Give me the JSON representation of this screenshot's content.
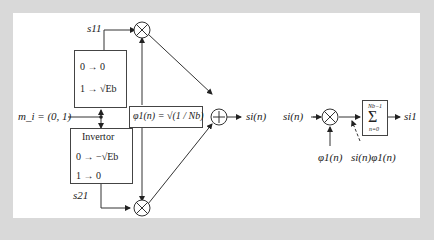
{
  "diagram": {
    "modulator": {
      "input_label": "m_i = (0, 1)",
      "upper_branch": {
        "output_label": "s11",
        "mapping_lines": [
          "0 → 0",
          "1 → √Eb"
        ]
      },
      "lower_branch": {
        "title": "Invertor",
        "output_label": "s21",
        "mapping_lines": [
          "0 → −√Eb",
          "1 → 0"
        ]
      },
      "basis_function_label": "φ1(n) = √(1 / Nb)",
      "multiplier_symbol": "×",
      "adder_symbol": "+",
      "output_label": "si(n)"
    },
    "correlator": {
      "input_label": "si(n)",
      "basis_input_label": "φ1(n)",
      "product_label": "si(n)φ1(n)",
      "summation": {
        "symbol": "Σ",
        "upper_limit": "Nb−1",
        "lower_limit": "n=0"
      },
      "output_label": "si1"
    }
  }
}
